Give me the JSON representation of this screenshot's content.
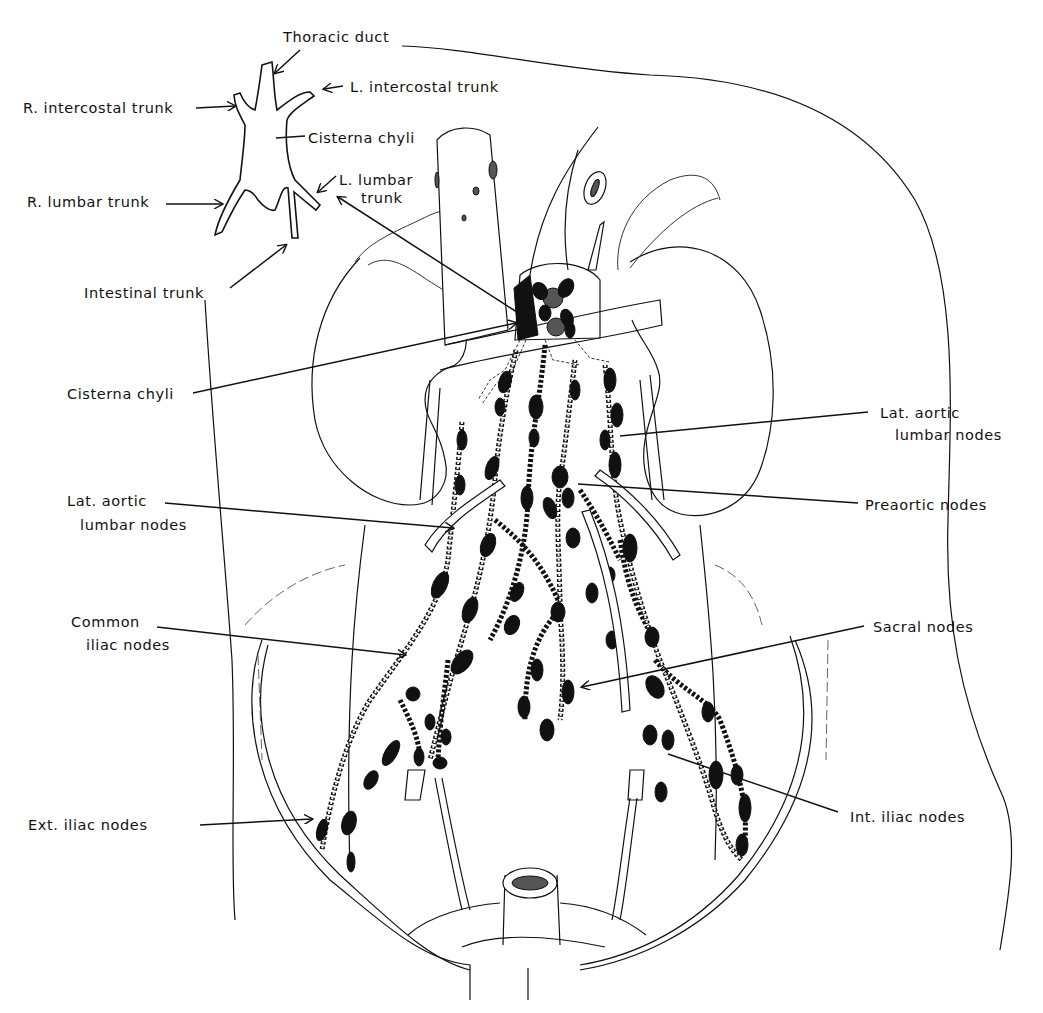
{
  "figure": {
    "inset": {
      "title": "Inset: cisterna chyli and its tributaries",
      "labels": [
        {
          "id": "thoracic-duct",
          "text": "Thoracic duct",
          "x": 283,
          "y": 42
        },
        {
          "id": "r-intercostal-trunk",
          "text": "R. intercostal trunk",
          "x": 23,
          "y": 113
        },
        {
          "id": "l-intercostal-trunk",
          "text": "L. intercostal trunk",
          "x": 350,
          "y": 92
        },
        {
          "id": "cisterna-chyli-inset",
          "text": "Cisterna chyli",
          "x": 308,
          "y": 143
        },
        {
          "id": "r-lumbar-trunk",
          "text": "R. lumbar trunk",
          "x": 27,
          "y": 207
        },
        {
          "id": "l-lumbar-trunk-1",
          "text": "L. lumbar",
          "x": 339,
          "y": 185
        },
        {
          "id": "l-lumbar-trunk-2",
          "text": "trunk",
          "x": 361,
          "y": 203
        },
        {
          "id": "intestinal-trunk",
          "text": "Intestinal trunk",
          "x": 84,
          "y": 298
        }
      ]
    },
    "labels": [
      {
        "id": "cisterna-chyli",
        "text": "Cisterna chyli",
        "x": 67,
        "y": 399
      },
      {
        "id": "lat-aortic-left-1",
        "text": "Lat. aortic",
        "x": 67,
        "y": 506
      },
      {
        "id": "lat-aortic-left-2",
        "text": "lumbar nodes",
        "x": 80,
        "y": 530
      },
      {
        "id": "common-iliac-1",
        "text": "Common",
        "x": 71,
        "y": 627
      },
      {
        "id": "common-iliac-2",
        "text": "iliac nodes",
        "x": 86,
        "y": 650
      },
      {
        "id": "ext-iliac",
        "text": "Ext. iliac nodes",
        "x": 28,
        "y": 830
      },
      {
        "id": "lat-aortic-right-1",
        "text": "Lat. aortic",
        "x": 880,
        "y": 418
      },
      {
        "id": "lat-aortic-right-2",
        "text": "lumbar nodes",
        "x": 895,
        "y": 440
      },
      {
        "id": "preaortic",
        "text": "Preaortic nodes",
        "x": 865,
        "y": 510
      },
      {
        "id": "sacral",
        "text": "Sacral nodes",
        "x": 873,
        "y": 632
      },
      {
        "id": "int-iliac",
        "text": "Int. iliac nodes",
        "x": 850,
        "y": 822
      }
    ],
    "leaders": [
      {
        "id": "thoracic-duct-leader",
        "x1": 300,
        "y1": 50,
        "x2": 275,
        "y2": 73,
        "arrow": true
      },
      {
        "id": "r-intercostal-leader",
        "x1": 196,
        "y1": 108,
        "x2": 235,
        "y2": 106,
        "arrow": true
      },
      {
        "id": "l-intercostal-leader",
        "x1": 343,
        "y1": 86,
        "x2": 324,
        "y2": 89,
        "arrow": true
      },
      {
        "id": "cisterna-inset-leader",
        "x1": 305,
        "y1": 136,
        "x2": 276,
        "y2": 138,
        "arrow": false
      },
      {
        "id": "r-lumbar-leader",
        "x1": 166,
        "y1": 204,
        "x2": 222,
        "y2": 204,
        "arrow": true
      },
      {
        "id": "l-lumbar-leader",
        "x1": 336,
        "y1": 176,
        "x2": 318,
        "y2": 192,
        "arrow": true
      },
      {
        "id": "intestinal-leader",
        "x1": 230,
        "y1": 288,
        "x2": 286,
        "y2": 245,
        "arrow": true
      },
      {
        "id": "cisterna-to-inset",
        "x1": 520,
        "y1": 314,
        "x2": 338,
        "y2": 197,
        "arrow": true
      },
      {
        "id": "cisterna-leader",
        "x1": 193,
        "y1": 393,
        "x2": 516,
        "y2": 323,
        "arrow": true
      },
      {
        "id": "lat-aortic-left-leader",
        "x1": 165,
        "y1": 503,
        "x2": 453,
        "y2": 528,
        "arrow": true
      },
      {
        "id": "common-iliac-leader",
        "x1": 157,
        "y1": 627,
        "x2": 405,
        "y2": 655,
        "arrow": true
      },
      {
        "id": "ext-iliac-leader",
        "x1": 200,
        "y1": 825,
        "x2": 312,
        "y2": 819,
        "arrow": true
      },
      {
        "id": "lat-aortic-right-leader",
        "x1": 868,
        "y1": 412,
        "x2": 620,
        "y2": 436,
        "arrow": false
      },
      {
        "id": "preaortic-leader",
        "x1": 858,
        "y1": 503,
        "x2": 578,
        "y2": 484,
        "arrow": false
      },
      {
        "id": "sacral-leader",
        "x1": 864,
        "y1": 626,
        "x2": 582,
        "y2": 687,
        "arrow": true
      },
      {
        "id": "int-iliac-leader",
        "x1": 838,
        "y1": 812,
        "x2": 668,
        "y2": 754,
        "arrow": false
      }
    ]
  }
}
